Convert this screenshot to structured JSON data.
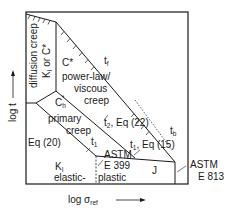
{
  "diagram": {
    "type": "time-stress regime map",
    "axes": {
      "x_label": "log σ",
      "x_label_sub": "ref",
      "y_label": "log t"
    },
    "regions": [
      {
        "id": "diffusion",
        "line1": "diffusion creep",
        "line2_main": "K",
        "line2_sub": "I",
        "line2_rest": " or C*"
      },
      {
        "id": "power-law",
        "param": "C*",
        "line1": "power-law/",
        "line2": "viscous",
        "line3": "creep"
      },
      {
        "id": "primary",
        "param_main": "C",
        "param_sub": "h",
        "param_sup": "*",
        "line1": "primary",
        "line2": "creep"
      },
      {
        "id": "elastic",
        "param_main": "K",
        "param_sub": "I",
        "line1": "elastic-"
      },
      {
        "id": "plastic",
        "line1": "plastic",
        "standard1": "ASTM",
        "standard2": "E 399"
      },
      {
        "id": "J",
        "param": "J"
      }
    ],
    "boundaries": {
      "tf": {
        "main": "t",
        "sub": "f"
      },
      "tb": {
        "main": "t",
        "sub": "b"
      },
      "t2": {
        "main": "t",
        "sub": "2",
        "rest": ", Eq (22)"
      },
      "t1_upper": {
        "main": "t",
        "sub": "1",
        "rest": ", Eq (15)"
      },
      "t1_lower": {
        "main": "t",
        "sub": "1"
      },
      "eq20": "Eq (20)"
    },
    "annotations": {
      "astm_right1": "ASTM",
      "astm_right2": "E 813"
    }
  }
}
